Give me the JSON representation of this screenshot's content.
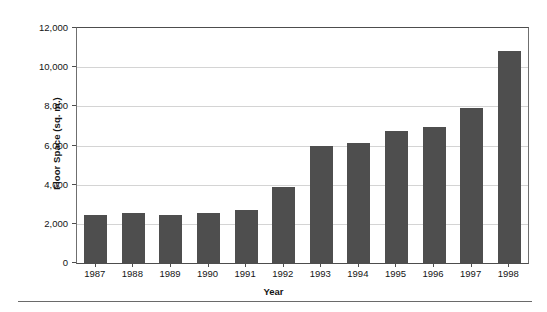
{
  "chart_data": {
    "type": "bar",
    "title": "",
    "subtitle": "",
    "xlabel": "Year",
    "ylabel": "Floor Space (sq. m.)",
    "categories": [
      "1987",
      "1988",
      "1989",
      "1990",
      "1991",
      "1992",
      "1993",
      "1994",
      "1995",
      "1996",
      "1997",
      "1998"
    ],
    "values": [
      2450,
      2550,
      2450,
      2550,
      2700,
      3900,
      6000,
      6150,
      6750,
      6950,
      7900,
      10850
    ],
    "ylim": [
      0,
      12000
    ],
    "ytick_values": [
      0,
      2000,
      4000,
      6000,
      8000,
      10000,
      12000
    ],
    "ytick_labels": [
      "0",
      "2,000",
      "4,000",
      "6,000",
      "8,000",
      "10,000",
      "12,000"
    ],
    "grid": true,
    "grid_axis": "y",
    "legend": false,
    "legend_position": "none",
    "bar_color": "#4e4e4e",
    "grid_color": "#d4d4d4",
    "axis_color": "#4d4d4d",
    "background_color": "#ffffff",
    "annotations": []
  }
}
